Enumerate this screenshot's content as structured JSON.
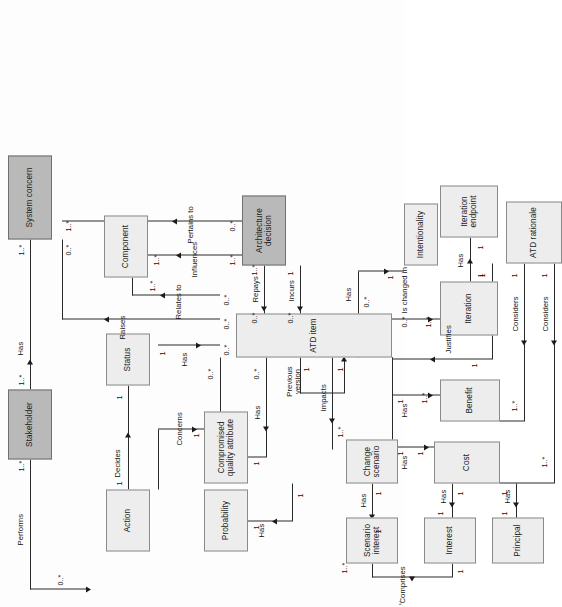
{
  "diagram": {
    "orientation": "rotated-90",
    "colors": {
      "node_fill": "#ededed",
      "node_fill_shaded": "#b9b9b9",
      "node_border": "#8a8a8a",
      "line": "#2a2a2a",
      "background": "#fdfdfd"
    },
    "nodes": [
      {
        "id": "stakeholder",
        "label": "Stakeholder",
        "shaded": true
      },
      {
        "id": "system_concern",
        "label": "System concern",
        "shaded": true
      },
      {
        "id": "arch_decision",
        "label": "Architecture decision",
        "shaded": true
      },
      {
        "id": "action",
        "label": "Action",
        "shaded": false
      },
      {
        "id": "status",
        "label": "Status",
        "shaded": false
      },
      {
        "id": "component",
        "label": "Component",
        "shaded": false
      },
      {
        "id": "probability",
        "label": "Probability",
        "shaded": false
      },
      {
        "id": "compromised",
        "label": "Compromised quality attribute",
        "shaded": false
      },
      {
        "id": "atd_item",
        "label": "ATD item",
        "shaded": false
      },
      {
        "id": "scenario_int",
        "label": "Scenario interest",
        "shaded": false
      },
      {
        "id": "change_scen",
        "label": "Change scenario",
        "shaded": false
      },
      {
        "id": "interest",
        "label": "Interest",
        "shaded": false
      },
      {
        "id": "principal",
        "label": "Principal",
        "shaded": false
      },
      {
        "id": "cost",
        "label": "Cost",
        "shaded": false
      },
      {
        "id": "benefit",
        "label": "Benefit",
        "shaded": false
      },
      {
        "id": "iteration",
        "label": "Iteration",
        "shaded": false
      },
      {
        "id": "iter_endpoint",
        "label": "Iteration endpoint",
        "shaded": false
      },
      {
        "id": "intentionality",
        "label": "Intentionality",
        "shaded": false
      },
      {
        "id": "atd_rationale",
        "label": "ATD rationale",
        "shaded": false
      }
    ],
    "relations": [
      {
        "id": "r01",
        "label": "Performs",
        "from": "stakeholder",
        "to": "action",
        "from_mult": "1..*",
        "to_mult": "0..*"
      },
      {
        "id": "r02",
        "label": "Has",
        "from": "stakeholder",
        "to": "system_concern",
        "from_mult": "1..*",
        "to_mult": "1..*"
      },
      {
        "id": "r03",
        "label": "Decides",
        "from": "action",
        "to": "status",
        "from_mult": "1",
        "to_mult": "1"
      },
      {
        "id": "r04",
        "label": "Has",
        "from": "status",
        "to": "atd_item",
        "from_mult": "1",
        "to_mult": "0..*"
      },
      {
        "id": "r05",
        "label": "Raises",
        "from": "atd_item",
        "to": "system_concern",
        "from_mult": "0..*",
        "to_mult": "0..*"
      },
      {
        "id": "r06",
        "label": "Relates to",
        "from": "atd_item",
        "to": "component",
        "from_mult": "0..*",
        "to_mult": "1..*"
      },
      {
        "id": "r07",
        "label": "Influences",
        "from": "component",
        "to": "arch_decision",
        "from_mult": "1..*",
        "to_mult": "1..*"
      },
      {
        "id": "r08",
        "label": "Pertains to",
        "from": "arch_decision",
        "to": "system_concern",
        "from_mult": "0..*",
        "to_mult": "1..*"
      },
      {
        "id": "r09",
        "label": "Repays",
        "from": "arch_decision",
        "to": "atd_item",
        "from_mult": "1..*",
        "to_mult": "0..*"
      },
      {
        "id": "r10",
        "label": "Incurs",
        "from": "arch_decision",
        "to": "atd_item",
        "from_mult": "1",
        "to_mult": "0..*"
      },
      {
        "id": "r11",
        "label": "Concerns",
        "from": "compromised",
        "to": "atd_item",
        "from_mult": "1",
        "to_mult": "0..*"
      },
      {
        "id": "r12",
        "label": "Has",
        "from": "compromised",
        "to": "atd_item",
        "from_mult": "1",
        "to_mult": "0..*"
      },
      {
        "id": "r13",
        "label": "Has",
        "from": "probability",
        "to": "change_scen",
        "from_mult": "1",
        "to_mult": "1"
      },
      {
        "id": "r14",
        "label": "Impacts",
        "from": "change_scen",
        "to": "atd_item",
        "from_mult": "1..*",
        "to_mult": "1"
      },
      {
        "id": "r15",
        "label": "Previous version",
        "from": "atd_item",
        "to": "atd_item",
        "from_mult": "1",
        "to_mult": "1"
      },
      {
        "id": "r16",
        "label": "Has",
        "from": "scenario_int",
        "to": "change_scen",
        "from_mult": "1",
        "to_mult": "1"
      },
      {
        "id": "r17",
        "label": "Comprises",
        "from": "interest",
        "to": "scenario_int",
        "from_mult": "1",
        "to_mult": "1..*"
      },
      {
        "id": "r18",
        "label": "Has",
        "from": "interest",
        "to": "cost",
        "from_mult": "1",
        "to_mult": "1"
      },
      {
        "id": "r19",
        "label": "Has",
        "from": "principal",
        "to": "cost",
        "from_mult": "1",
        "to_mult": "1"
      },
      {
        "id": "r20",
        "label": "Has",
        "from": "atd_item",
        "to": "cost",
        "from_mult": "1",
        "to_mult": "1"
      },
      {
        "id": "r21",
        "label": "Has",
        "from": "atd_item",
        "to": "benefit",
        "from_mult": "1",
        "to_mult": "1..*"
      },
      {
        "id": "r22",
        "label": "Considers",
        "from": "atd_rationale",
        "to": "cost",
        "from_mult": "1",
        "to_mult": "1..*"
      },
      {
        "id": "r23",
        "label": "Considers",
        "from": "atd_rationale",
        "to": "benefit",
        "from_mult": "1",
        "to_mult": "1..*"
      },
      {
        "id": "r24",
        "label": "Justifies",
        "from": "atd_rationale",
        "to": "atd_item",
        "from_mult": "1",
        "to_mult": "1"
      },
      {
        "id": "r25",
        "label": "Is changed in",
        "from": "atd_item",
        "to": "iteration",
        "from_mult": "0..*",
        "to_mult": "1..*"
      },
      {
        "id": "r26",
        "label": "Has",
        "from": "iteration",
        "to": "iter_endpoint",
        "from_mult": "1",
        "to_mult": "1"
      },
      {
        "id": "r27",
        "label": "Has",
        "from": "atd_item",
        "to": "intentionality",
        "from_mult": "0..*",
        "to_mult": "1"
      }
    ],
    "multiplicities": {
      "one": "1",
      "one_many": "1..*",
      "zero_many": "0..*"
    },
    "page_marker": "2"
  }
}
